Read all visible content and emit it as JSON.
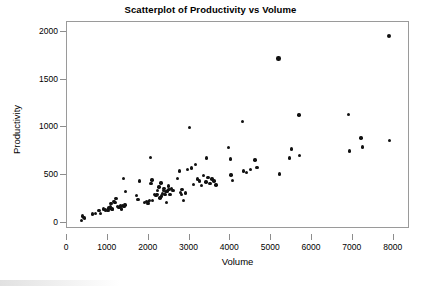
{
  "chart_data": {
    "type": "scatter",
    "title": "Scatterplot of Productivity vs Volume",
    "xlabel": "Volume",
    "ylabel": "Productivity",
    "xlim": [
      0,
      8400
    ],
    "ylim": [
      -60,
      2100
    ],
    "xticks": [
      0,
      1000,
      2000,
      3000,
      4000,
      5000,
      6000,
      7000,
      8000
    ],
    "xticklabels": [
      "0",
      "1000",
      "2000",
      "3000",
      "4000",
      "5000",
      "6000",
      "7000",
      "8000"
    ],
    "yticks": [
      0,
      500,
      1000,
      1500,
      2000
    ],
    "yticklabels": [
      "0",
      "500",
      "1000",
      "1500",
      "2000"
    ],
    "grid": false,
    "legend": null,
    "marker": {
      "shape": "circle",
      "color": "#111111",
      "size": 3.4
    },
    "series": [
      {
        "name": "Productivity vs Volume",
        "points": [
          [
            350,
            30
          ],
          [
            380,
            75
          ],
          [
            400,
            60
          ],
          [
            430,
            55
          ],
          [
            620,
            95
          ],
          [
            700,
            105
          ],
          [
            780,
            130
          ],
          [
            820,
            100
          ],
          [
            900,
            150
          ],
          [
            950,
            140
          ],
          [
            1000,
            135
          ],
          [
            1030,
            160
          ],
          [
            1060,
            175
          ],
          [
            1080,
            205
          ],
          [
            1100,
            150
          ],
          [
            1120,
            145
          ],
          [
            1150,
            230
          ],
          [
            1180,
            215
          ],
          [
            1200,
            260
          ],
          [
            1230,
            175
          ],
          [
            1260,
            165
          ],
          [
            1290,
            170
          ],
          [
            1310,
            180
          ],
          [
            1340,
            150
          ],
          [
            1360,
            185
          ],
          [
            1380,
            465
          ],
          [
            1400,
            175
          ],
          [
            1420,
            190
          ],
          [
            1430,
            330
          ],
          [
            1700,
            290
          ],
          [
            1740,
            245
          ],
          [
            1780,
            440
          ],
          [
            1900,
            215
          ],
          [
            1950,
            225
          ],
          [
            1980,
            205
          ],
          [
            2000,
            225
          ],
          [
            2020,
            235
          ],
          [
            2050,
            685
          ],
          [
            2060,
            415
          ],
          [
            2080,
            450
          ],
          [
            2100,
            240
          ],
          [
            2150,
            300
          ],
          [
            2180,
            290
          ],
          [
            2200,
            300
          ],
          [
            2220,
            345
          ],
          [
            2250,
            380
          ],
          [
            2280,
            265
          ],
          [
            2300,
            420
          ],
          [
            2320,
            285
          ],
          [
            2340,
            310
          ],
          [
            2360,
            345
          ],
          [
            2380,
            360
          ],
          [
            2400,
            300
          ],
          [
            2420,
            330
          ],
          [
            2440,
            215
          ],
          [
            2460,
            335
          ],
          [
            2480,
            390
          ],
          [
            2500,
            355
          ],
          [
            2520,
            300
          ],
          [
            2560,
            360
          ],
          [
            2600,
            345
          ],
          [
            2700,
            465
          ],
          [
            2750,
            545
          ],
          [
            2780,
            320
          ],
          [
            2800,
            300
          ],
          [
            2820,
            355
          ],
          [
            2850,
            235
          ],
          [
            2900,
            315
          ],
          [
            2950,
            560
          ],
          [
            3000,
            1000
          ],
          [
            3050,
            575
          ],
          [
            3100,
            405
          ],
          [
            3150,
            610
          ],
          [
            3200,
            460
          ],
          [
            3250,
            440
          ],
          [
            3300,
            395
          ],
          [
            3350,
            500
          ],
          [
            3400,
            430
          ],
          [
            3420,
            680
          ],
          [
            3450,
            475
          ],
          [
            3500,
            415
          ],
          [
            3550,
            460
          ],
          [
            3600,
            440
          ],
          [
            3650,
            400
          ],
          [
            3950,
            790
          ],
          [
            4000,
            670
          ],
          [
            4020,
            505
          ],
          [
            4050,
            445
          ],
          [
            4300,
            1060
          ],
          [
            4320,
            545
          ],
          [
            4400,
            530
          ],
          [
            4500,
            560
          ],
          [
            4600,
            660
          ],
          [
            4650,
            580
          ],
          [
            5180,
            1720
          ],
          [
            5200,
            515
          ],
          [
            5450,
            680
          ],
          [
            5500,
            775
          ],
          [
            5680,
            1130
          ],
          [
            5700,
            705
          ],
          [
            6900,
            1135
          ],
          [
            6920,
            755
          ],
          [
            7200,
            890
          ],
          [
            7230,
            795
          ],
          [
            7880,
            1955
          ],
          [
            7900,
            865
          ]
        ]
      }
    ]
  }
}
